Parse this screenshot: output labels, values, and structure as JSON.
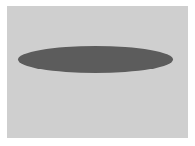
{
  "canvas": {
    "width": 195,
    "height": 146,
    "background_color": "#ffffff"
  },
  "frame": {
    "color": "#cfcfcf"
  },
  "shapes": [
    {
      "type": "ellipse",
      "color": "#5c5c5c",
      "center": [
        95,
        59
      ],
      "width": 155,
      "height": 27
    }
  ]
}
